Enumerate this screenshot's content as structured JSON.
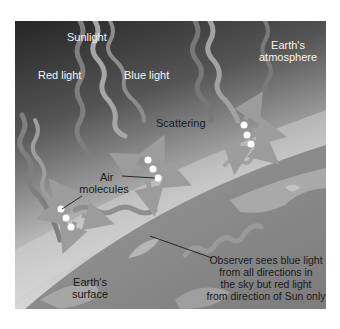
{
  "figure": {
    "labels": {
      "sunlight": "Sunlight",
      "red_light": "Red light",
      "blue_light": "Blue light",
      "atmosphere_line1": "Earth's",
      "atmosphere_line2": "atmosphere",
      "scattering": "Scattering",
      "air_line1": "Air",
      "air_line2": "molecules",
      "surface_line1": "Earth's",
      "surface_line2": "surface",
      "observer_line1": "Observer sees blue light",
      "observer_line2": "from all directions in",
      "observer_line3": "the sky but red light",
      "observer_line4": "from direction of Sun only"
    },
    "colors": {
      "sky_top": "#2e2e2e",
      "sky_bottom": "#dcdcdc",
      "earth": "#8a8a8a",
      "land": "#b4b4b4",
      "wave_red": "#7a7a7a",
      "wave_blue": "#a8a8a8",
      "molecule": "#ffffff"
    }
  }
}
